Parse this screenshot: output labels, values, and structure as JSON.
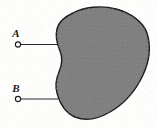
{
  "figure": {
    "width": 157,
    "height": 128,
    "background_color": "#fdfdfc",
    "caption": ""
  },
  "region": {
    "name": "shaded-region",
    "fill_color": "#808080",
    "stroke_color": "#1c1c1c",
    "stroke_width": 1.4,
    "description": "irregular closed blob region, concave on left edge"
  },
  "points": [
    {
      "id": "A",
      "label": "A",
      "label_x": 16,
      "label_y": 37,
      "marker_x": 18,
      "marker_y": 44.5,
      "marker_radius": 2.6,
      "leader_from_x": 21,
      "leader_to_x": 58,
      "leader_y": 44.5,
      "position": "outside-region"
    },
    {
      "id": "B",
      "label": "B",
      "label_x": 16,
      "label_y": 92,
      "marker_x": 18,
      "marker_y": 99,
      "marker_radius": 2.6,
      "leader_from_x": 21,
      "leader_to_x": 58,
      "leader_y": 99,
      "position": "outside-region"
    }
  ],
  "colors": {
    "region_fill": "#808080",
    "outline": "#1c1c1c",
    "leader_line": "#2b2b2b",
    "marker_stroke": "#1c1c1c",
    "marker_fill": "#fdfdfc",
    "page": "#fdfdfc"
  }
}
